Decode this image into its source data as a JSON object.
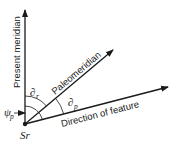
{
  "diagram": {
    "lines": {
      "present_meridian": "Present meridian",
      "paleomeridian": "Paleomeridian",
      "direction_of_feature": "Direction of feature"
    },
    "symbols": {
      "origin": "Sr",
      "angle_meridians": "∂",
      "angle_meridians_sub": "r",
      "angle_feature": "∂",
      "angle_feature_sub": "p",
      "angle_psi": "ψ",
      "angle_psi_sub": "p"
    },
    "colors": {
      "stroke": "#1a1a1a",
      "background": "#ffffff"
    }
  }
}
